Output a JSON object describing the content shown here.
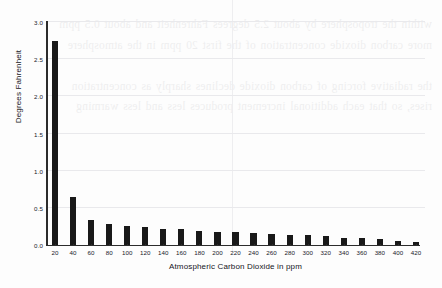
{
  "page": {
    "background_color": "#fdfdfd",
    "bleed_through_text": "within the troposphere by about 2.5 degrees Fahrenheit and about 0.5 ppm\nmore carbon dioxide concentration of the first 20 ppm in the atmosphere\n\nthe radiative forcing of carbon dioxide declines sharply as concentration\nrises, so that each additional increment produces less and less warming"
  },
  "chart_data": {
    "type": "bar",
    "title": "",
    "xlabel": "Atmospheric Carbon Dioxide in ppm",
    "ylabel": "Degrees Fahrenheit",
    "categories": [
      20,
      40,
      60,
      80,
      100,
      120,
      140,
      160,
      180,
      200,
      220,
      240,
      260,
      280,
      300,
      320,
      340,
      360,
      380,
      400,
      420
    ],
    "values": [
      2.75,
      0.64,
      0.34,
      0.28,
      0.26,
      0.24,
      0.22,
      0.21,
      0.19,
      0.18,
      0.17,
      0.16,
      0.15,
      0.14,
      0.13,
      0.12,
      0.1,
      0.09,
      0.08,
      0.06,
      0.04
    ],
    "xtick_labels": [
      "20",
      "40",
      "60",
      "80",
      "100",
      "120",
      "140",
      "160",
      "180",
      "200",
      "220",
      "240",
      "260",
      "280",
      "300",
      "320",
      "340",
      "360",
      "380",
      "400",
      "420"
    ],
    "ytick_labels": [
      "0.0",
      "0.5",
      "1.0",
      "1.5",
      "2.0",
      "2.5",
      "3.0"
    ],
    "ytick_values": [
      0.0,
      0.5,
      1.0,
      1.5,
      2.0,
      2.5,
      3.0
    ],
    "ylim": [
      0.0,
      3.0
    ],
    "xlim": [
      10,
      430
    ],
    "grid": "horizontal",
    "legend": "none",
    "bar_color": "#191919",
    "gridline_color": "#e9e9ec",
    "axis_color": "#2c2c2c"
  }
}
